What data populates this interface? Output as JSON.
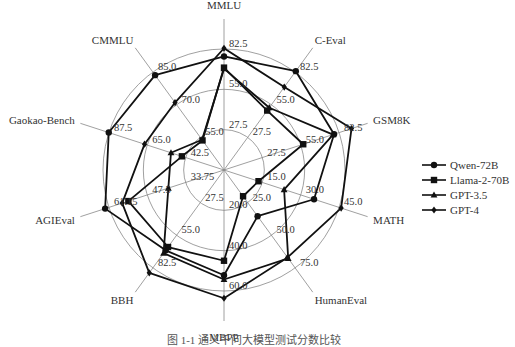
{
  "chart_data": {
    "type": "radar",
    "title": "",
    "caption": "图 1-1  通义千问大模型测试分数比较",
    "axes": [
      {
        "name": "MMLU",
        "ticks": [
          "27.5",
          "55.0",
          "82.5"
        ],
        "min": 0,
        "max": 82.5
      },
      {
        "name": "C-Eval",
        "ticks": [
          "27.5",
          "55.0",
          "82.5"
        ],
        "min": 0,
        "max": 82.5
      },
      {
        "name": "GSM8K",
        "ticks": [
          "27.5",
          "55.0",
          "82.5"
        ],
        "min": 0,
        "max": 82.5
      },
      {
        "name": "MATH",
        "ticks": [
          "15.0",
          "30.0",
          "45.0"
        ],
        "min": 0,
        "max": 45.0
      },
      {
        "name": "HumanEval",
        "ticks": [
          "25.0",
          "50.0",
          "75.0"
        ],
        "min": 0,
        "max": 75.0
      },
      {
        "name": "MBPP",
        "ticks": [
          "20.0",
          "40.0",
          "60.0"
        ],
        "min": 0,
        "max": 60.0
      },
      {
        "name": "BBH",
        "ticks": [
          "27.5",
          "55.0",
          "82.5"
        ],
        "min": 0,
        "max": 82.5
      },
      {
        "name": "AGIEval",
        "ticks": [
          "33.75",
          "47.5",
          "61.15"
        ],
        "min": 20.0,
        "max": 61.15
      },
      {
        "name": "Gaokao-Bench",
        "ticks": [
          "42.5",
          "65.0",
          "87.5"
        ],
        "min": 20.0,
        "max": 87.5
      },
      {
        "name": "CMMLU",
        "ticks": [
          "55.0",
          "70.0",
          "85.0"
        ],
        "min": 40.0,
        "max": 85.0
      }
    ],
    "series": [
      {
        "name": "Qwen-72B",
        "marker": "circle",
        "values": [
          77.4,
          83.3,
          78.9,
          35.2,
          35.4,
          52.2,
          67.7,
          62.5,
          87.6,
          83.6
        ]
      },
      {
        "name": "Llama-2-70B",
        "marker": "square",
        "values": [
          69.8,
          50.1,
          56.8,
          13.5,
          20.1,
          45.0,
          64.9,
          54.2,
          44.7,
          53.6
        ]
      },
      {
        "name": "GPT-3.5",
        "marker": "triangle",
        "values": [
          69.1,
          52.5,
          78.2,
          23.5,
          67.7,
          54.3,
          70.1,
          39.9,
          51.1,
          53.9
        ]
      },
      {
        "name": "GPT-4",
        "marker": "diamond",
        "values": [
          83.0,
          69.9,
          91.4,
          45.8,
          67.0,
          63.6,
          86.7,
          56.4,
          66.6,
          71.0
        ]
      }
    ],
    "legend": {
      "position": "right",
      "entries": [
        "Qwen-72B",
        "Llama-2-70B",
        "GPT-3.5",
        "GPT-4"
      ]
    },
    "grid": true
  }
}
